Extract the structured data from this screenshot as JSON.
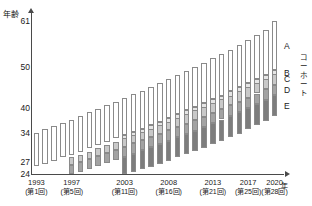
{
  "chart_data": {
    "type": "bar",
    "title": "",
    "ylabel": "年齢",
    "xlabel": "年",
    "ylim": [
      24,
      63
    ],
    "yticks": [
      24,
      27,
      34,
      40,
      50,
      61
    ],
    "ytick_labels": [
      "24",
      "27",
      "34",
      "40",
      "50",
      "61"
    ],
    "grid": false,
    "legend_position": "right",
    "legend_title": "コーホート",
    "legend_entries": [
      {
        "key": "A",
        "label": "A",
        "color": "#ffffff"
      },
      {
        "key": "B",
        "label": "B",
        "color": "#e6e6e6"
      },
      {
        "key": "C",
        "label": "C",
        "color": "#c9c9c9"
      },
      {
        "key": "D",
        "label": "D",
        "color": "#a3a3a3"
      },
      {
        "key": "E",
        "label": "E",
        "color": "#7d7d7d"
      }
    ],
    "xtick_labels": [
      {
        "year": "1993",
        "round": "(第1回)"
      },
      {
        "year": "1997",
        "round": "(第5回)"
      },
      {
        "year": "2003",
        "round": "(第11回)"
      },
      {
        "year": "2008",
        "round": "(第16回)"
      },
      {
        "year": "2013",
        "round": "(第21回)"
      },
      {
        "year": "2017",
        "round": "(第25回)"
      },
      {
        "year": "2020",
        "round": "(第28回)"
      }
    ],
    "categories": [
      "1993",
      "1994",
      "1995",
      "1996",
      "1997",
      "1998",
      "1999",
      "2000",
      "2001",
      "2002",
      "2003",
      "2004",
      "2005",
      "2006",
      "2007",
      "2008",
      "2009",
      "2010",
      "2011",
      "2012",
      "2013",
      "2014",
      "2015",
      "2016",
      "2017",
      "2018",
      "2019",
      "2020"
    ],
    "rounds": [
      "第1回",
      "第2回",
      "第3回",
      "第4回",
      "第5回",
      "第6回",
      "第7回",
      "第8回",
      "第9回",
      "第10回",
      "第11回",
      "第12回",
      "第13回",
      "第14回",
      "第15回",
      "第16回",
      "第17回",
      "第18回",
      "第19回",
      "第20回",
      "第21回",
      "第22回",
      "第23回",
      "第24回",
      "第25回",
      "第26回",
      "第27回",
      "第28回"
    ],
    "series": [
      {
        "name": "A",
        "low": [
          26.0,
          26.5,
          27.2,
          28.0,
          28.7,
          29.4,
          30.2,
          31.0,
          31.8,
          32.6,
          33.4,
          34.2,
          35.0,
          35.9,
          36.7,
          37.6,
          38.5,
          39.4,
          40.3,
          41.2,
          42.1,
          43.0,
          44.0,
          45.0,
          46.0,
          47.0,
          48.0,
          49.2
        ],
        "high": [
          34.0,
          34.8,
          35.6,
          36.4,
          37.2,
          38.0,
          38.9,
          39.8,
          40.6,
          41.5,
          42.4,
          43.3,
          44.2,
          45.1,
          46.0,
          47.0,
          48.0,
          49.0,
          50.0,
          51.0,
          52.0,
          53.0,
          54.1,
          55.2,
          56.4,
          57.6,
          58.9,
          61.0
        ]
      },
      {
        "name": "B",
        "low": [
          null,
          null,
          null,
          null,
          null,
          null,
          null,
          null,
          null,
          null,
          32.2,
          33.0,
          33.8,
          34.6,
          35.4,
          36.2,
          37.0,
          37.9,
          38.8,
          39.7,
          40.6,
          41.5,
          42.5,
          43.5,
          44.5,
          45.5,
          46.6,
          47.8
        ],
        "high": [
          null,
          null,
          null,
          null,
          null,
          null,
          null,
          null,
          null,
          null,
          33.4,
          34.2,
          35.0,
          35.9,
          36.7,
          37.6,
          38.5,
          39.4,
          40.3,
          41.2,
          42.1,
          43.0,
          44.0,
          45.0,
          46.0,
          47.0,
          48.0,
          49.2
        ]
      },
      {
        "name": "C",
        "low": [
          null,
          null,
          null,
          null,
          26.2,
          26.9,
          27.6,
          28.3,
          29.0,
          29.8,
          30.6,
          31.4,
          32.2,
          33.0,
          33.8,
          34.6,
          35.4,
          36.2,
          37.0,
          37.9,
          38.8,
          39.7,
          40.6,
          41.5,
          42.5,
          43.5,
          44.5,
          45.6
        ],
        "high": [
          null,
          null,
          null,
          null,
          28.0,
          28.7,
          29.4,
          30.2,
          31.0,
          31.8,
          32.6,
          33.4,
          34.2,
          35.0,
          35.9,
          36.7,
          37.6,
          38.5,
          39.4,
          40.3,
          41.2,
          42.1,
          43.0,
          44.0,
          45.0,
          46.0,
          47.0,
          48.2
        ]
      },
      {
        "name": "D",
        "low": [
          null,
          null,
          null,
          null,
          24.0,
          24.6,
          25.2,
          25.9,
          26.6,
          27.3,
          28.1,
          28.9,
          29.7,
          30.5,
          31.3,
          32.1,
          32.9,
          33.7,
          34.5,
          35.4,
          36.3,
          37.2,
          38.1,
          39.0,
          40.0,
          41.0,
          42.0,
          43.1
        ],
        "high": [
          null,
          null,
          null,
          null,
          26.2,
          26.9,
          27.6,
          28.3,
          29.0,
          29.8,
          30.6,
          31.4,
          32.2,
          33.0,
          33.8,
          34.6,
          35.4,
          36.2,
          37.0,
          37.9,
          38.8,
          39.7,
          40.6,
          41.5,
          42.5,
          43.5,
          44.5,
          45.6
        ]
      },
      {
        "name": "E",
        "low": [
          null,
          null,
          null,
          null,
          null,
          null,
          null,
          null,
          null,
          null,
          24.0,
          24.5,
          25.1,
          25.8,
          26.5,
          27.2,
          28.0,
          28.8,
          29.6,
          30.4,
          31.2,
          32.0,
          32.9,
          33.8,
          34.8,
          35.8,
          36.8,
          38.0
        ],
        "high": [
          null,
          null,
          null,
          null,
          null,
          null,
          null,
          null,
          null,
          null,
          28.1,
          28.9,
          29.7,
          30.5,
          31.3,
          32.1,
          32.9,
          33.7,
          34.5,
          35.4,
          36.3,
          37.2,
          38.1,
          39.0,
          40.0,
          41.0,
          42.0,
          43.1
        ]
      }
    ]
  }
}
